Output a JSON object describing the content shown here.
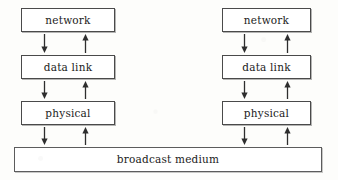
{
  "diagram": {
    "background_color": "#fdfdfb",
    "line_color": "#4a4a4a",
    "text_color": "#1b1b1b",
    "stacks": [
      {
        "name": "left-stack",
        "layers": [
          {
            "id": "network",
            "label": "network",
            "x": 21,
            "y": 8,
            "w": 94,
            "h": 24
          },
          {
            "id": "data-link",
            "label": "data link",
            "x": 21,
            "y": 55,
            "w": 94,
            "h": 24
          },
          {
            "id": "physical",
            "label": "physical",
            "x": 21,
            "y": 101,
            "w": 94,
            "h": 24
          }
        ],
        "arrow_pairs": [
          {
            "id": "network-datalink",
            "down_x": 44,
            "up_x": 85,
            "y": 34,
            "h": 19
          },
          {
            "id": "datalink-physical",
            "down_x": 44,
            "up_x": 85,
            "y": 81,
            "h": 18
          },
          {
            "id": "physical-medium",
            "down_x": 44,
            "up_x": 85,
            "y": 127,
            "h": 18
          }
        ]
      },
      {
        "name": "right-stack",
        "layers": [
          {
            "id": "network",
            "label": "network",
            "x": 222,
            "y": 8,
            "w": 89,
            "h": 24
          },
          {
            "id": "data-link",
            "label": "data link",
            "x": 222,
            "y": 55,
            "w": 89,
            "h": 24
          },
          {
            "id": "physical",
            "label": "physical",
            "x": 222,
            "y": 101,
            "w": 89,
            "h": 24
          }
        ],
        "arrow_pairs": [
          {
            "id": "network-datalink",
            "down_x": 244,
            "up_x": 287,
            "y": 34,
            "h": 19
          },
          {
            "id": "datalink-physical",
            "down_x": 244,
            "up_x": 287,
            "y": 81,
            "h": 18
          },
          {
            "id": "physical-medium",
            "down_x": 244,
            "up_x": 287,
            "y": 127,
            "h": 18
          }
        ]
      }
    ],
    "medium": {
      "id": "broadcast-medium",
      "label": "broadcast medium",
      "x": 14,
      "y": 147,
      "w": 308,
      "h": 25
    }
  }
}
